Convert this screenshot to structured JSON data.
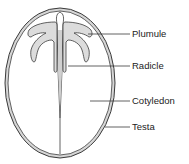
{
  "colors": {
    "outline": "#3a3a3a",
    "testa_fill": "#d6d6d6",
    "plumule_fill": "#dcdcdc",
    "background": "#ffffff",
    "text": "#222222"
  },
  "labels": [
    {
      "id": "plumule",
      "text": "Plumule"
    },
    {
      "id": "radicle",
      "text": "Radicle"
    },
    {
      "id": "cotyledon",
      "text": "Cotyledon"
    },
    {
      "id": "testa",
      "text": "Testa"
    }
  ]
}
